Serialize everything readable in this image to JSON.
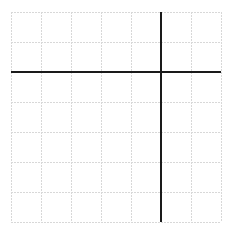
{
  "diagram": {
    "type": "coordinate-grid",
    "columns": 7,
    "rows": 7,
    "cell_size_px": 30,
    "origin": {
      "x": 11,
      "y": 12
    },
    "y_axis_column_index": 5,
    "x_axis_row_index": 2,
    "colors": {
      "grid": "#d8d8d8",
      "axis": "#1a1a1a",
      "background": "#ffffff"
    }
  }
}
